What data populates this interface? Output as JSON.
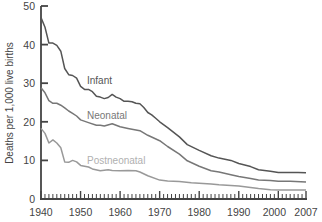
{
  "chart_data": {
    "type": "line",
    "title": "",
    "xlabel": "",
    "ylabel": "Deaths per 1,000 live births",
    "xlim": [
      1940,
      2007
    ],
    "ylim": [
      0,
      50
    ],
    "x_ticks": [
      1940,
      1950,
      1960,
      1970,
      1980,
      1990,
      2000,
      2007
    ],
    "y_ticks": [
      0,
      10,
      20,
      30,
      40,
      50
    ],
    "grid": false,
    "legend": "inline labels",
    "series": [
      {
        "name": "Infant",
        "color": "#555555",
        "label_pos": {
          "x": 1947.5,
          "y": 31.5
        },
        "points": [
          [
            1940,
            47.0
          ],
          [
            1941,
            44.5
          ],
          [
            1942,
            40.4
          ],
          [
            1943,
            40.4
          ],
          [
            1944,
            39.8
          ],
          [
            1945,
            38.3
          ],
          [
            1946,
            33.8
          ],
          [
            1947,
            32.2
          ],
          [
            1948,
            32.0
          ],
          [
            1949,
            31.3
          ],
          [
            1950,
            29.2
          ],
          [
            1951,
            28.4
          ],
          [
            1952,
            28.4
          ],
          [
            1953,
            27.8
          ],
          [
            1954,
            26.6
          ],
          [
            1955,
            26.4
          ],
          [
            1956,
            26.0
          ],
          [
            1957,
            26.3
          ],
          [
            1958,
            27.1
          ],
          [
            1959,
            26.4
          ],
          [
            1960,
            26.0
          ],
          [
            1961,
            25.3
          ],
          [
            1962,
            25.3
          ],
          [
            1963,
            25.2
          ],
          [
            1964,
            24.8
          ],
          [
            1965,
            24.7
          ],
          [
            1966,
            23.7
          ],
          [
            1967,
            22.4
          ],
          [
            1968,
            21.8
          ],
          [
            1969,
            20.9
          ],
          [
            1970,
            20.0
          ],
          [
            1972,
            18.5
          ],
          [
            1975,
            16.1
          ],
          [
            1977,
            14.1
          ],
          [
            1980,
            12.6
          ],
          [
            1983,
            11.2
          ],
          [
            1985,
            10.6
          ],
          [
            1988,
            10.0
          ],
          [
            1990,
            9.2
          ],
          [
            1993,
            8.4
          ],
          [
            1995,
            7.6
          ],
          [
            1998,
            7.2
          ],
          [
            2000,
            6.9
          ],
          [
            2003,
            6.9
          ],
          [
            2005,
            6.9
          ],
          [
            2007,
            6.8
          ]
        ]
      },
      {
        "name": "Neonatal",
        "color": "#777777",
        "label_pos": {
          "x": 1947.5,
          "y": 21.5
        },
        "points": [
          [
            1940,
            28.8
          ],
          [
            1941,
            27.5
          ],
          [
            1942,
            25.5
          ],
          [
            1943,
            24.8
          ],
          [
            1944,
            24.8
          ],
          [
            1945,
            24.3
          ],
          [
            1946,
            23.6
          ],
          [
            1947,
            22.8
          ],
          [
            1948,
            22.2
          ],
          [
            1949,
            21.5
          ],
          [
            1950,
            20.5
          ],
          [
            1952,
            19.8
          ],
          [
            1954,
            19.1
          ],
          [
            1955,
            19.1
          ],
          [
            1956,
            18.9
          ],
          [
            1958,
            19.5
          ],
          [
            1960,
            18.7
          ],
          [
            1962,
            18.3
          ],
          [
            1965,
            17.7
          ],
          [
            1967,
            16.5
          ],
          [
            1970,
            15.1
          ],
          [
            1972,
            13.6
          ],
          [
            1975,
            11.6
          ],
          [
            1977,
            9.9
          ],
          [
            1980,
            8.5
          ],
          [
            1983,
            7.3
          ],
          [
            1985,
            7.0
          ],
          [
            1988,
            6.3
          ],
          [
            1990,
            5.8
          ],
          [
            1993,
            5.3
          ],
          [
            1995,
            4.9
          ],
          [
            1998,
            4.8
          ],
          [
            2000,
            4.6
          ],
          [
            2003,
            4.6
          ],
          [
            2007,
            4.4
          ]
        ]
      },
      {
        "name": "Postneonatal",
        "color": "#999999",
        "label_color": "#b0b0b0",
        "label_pos": {
          "x": 1947.5,
          "y": 11.5
        },
        "points": [
          [
            1940,
            18.3
          ],
          [
            1941,
            17.0
          ],
          [
            1942,
            14.5
          ],
          [
            1943,
            15.3
          ],
          [
            1944,
            14.5
          ],
          [
            1945,
            13.3
          ],
          [
            1946,
            9.6
          ],
          [
            1947,
            9.5
          ],
          [
            1948,
            10.0
          ],
          [
            1949,
            9.6
          ],
          [
            1950,
            8.7
          ],
          [
            1951,
            8.5
          ],
          [
            1952,
            8.3
          ],
          [
            1953,
            7.8
          ],
          [
            1955,
            7.3
          ],
          [
            1957,
            7.6
          ],
          [
            1958,
            7.4
          ],
          [
            1960,
            7.3
          ],
          [
            1962,
            7.4
          ],
          [
            1964,
            7.3
          ],
          [
            1965,
            7.0
          ],
          [
            1967,
            6.0
          ],
          [
            1970,
            4.9
          ],
          [
            1972,
            4.7
          ],
          [
            1975,
            4.5
          ],
          [
            1978,
            4.2
          ],
          [
            1980,
            4.1
          ],
          [
            1983,
            3.9
          ],
          [
            1985,
            3.7
          ],
          [
            1988,
            3.5
          ],
          [
            1990,
            3.4
          ],
          [
            1993,
            3.0
          ],
          [
            1995,
            2.7
          ],
          [
            1998,
            2.4
          ],
          [
            2000,
            2.3
          ],
          [
            2003,
            2.3
          ],
          [
            2007,
            2.3
          ]
        ]
      }
    ]
  },
  "axis": {
    "ylabel": "Deaths per 1,000 live births",
    "x_tick_labels": [
      "1940",
      "1950",
      "1960",
      "1970",
      "1980",
      "1990",
      "2000",
      "2007"
    ],
    "y_tick_labels": [
      "0",
      "10",
      "20",
      "30",
      "40",
      "50"
    ]
  },
  "labels": {
    "infant": "Infant",
    "neonatal": "Neonatal",
    "postneonatal": "Postneonatal"
  }
}
